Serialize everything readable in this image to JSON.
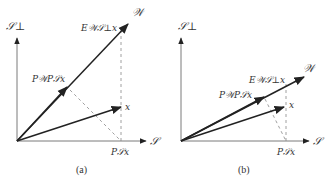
{
  "figure": {
    "panels": [
      {
        "id": "a",
        "caption": "(a)",
        "labels": {
          "s_perp": "𝒮⊥",
          "w": "𝒲",
          "s": "𝒮",
          "x": "x",
          "ps_x": "P𝒮x",
          "pw_ps_x": "P𝒲P𝒮x",
          "e_ws_perp_x": "E𝒲𝒮⊥x"
        }
      },
      {
        "id": "b",
        "caption": "(b)",
        "labels": {
          "s_perp": "𝒮⊥",
          "w": "𝒲",
          "s": "𝒮",
          "x": "x",
          "ps_x": "P𝒮x",
          "pw_ps_x": "P𝒲P𝒮x",
          "e_ws_perp_x": "E𝒲𝒮⊥x"
        }
      }
    ],
    "colors": {
      "vector": "#222222",
      "axis": "#7a7a7a",
      "dashed": "#888888",
      "text": "#333333"
    }
  }
}
